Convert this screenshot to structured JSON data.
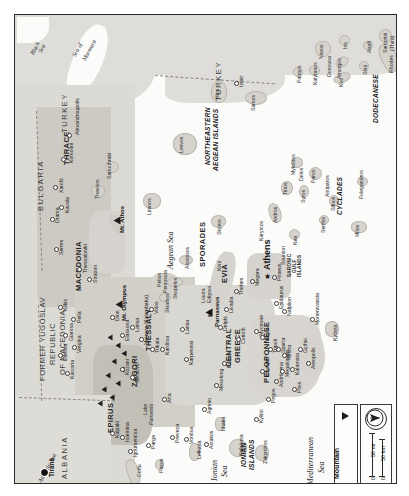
{
  "map": {
    "title": "Greece",
    "orientation": "rotated-90-ccw",
    "frame_border_color": "#2b2b2b",
    "sea_color": "#fbfbfa",
    "land_color": "#dedcd8",
    "highland_color": "#c3bfb8",
    "countries": [
      {
        "name": "TURKEY",
        "x": 46,
        "y": 118
      },
      {
        "name": "TURKEY",
        "x": 200,
        "y": 86
      },
      {
        "name": "BULGARIA",
        "x": 22,
        "y": 196
      },
      {
        "name": "FORMER YUGOSLAV",
        "x": 24,
        "y": 350
      },
      {
        "name": "REPUBLIC",
        "x": 34,
        "y": 345
      },
      {
        "name": "OF MACEDONIA",
        "x": 44,
        "y": 352
      },
      {
        "name": "ALBANIA",
        "x": 46,
        "y": 460
      }
    ],
    "regions": [
      {
        "name": "THRACE",
        "x": 48,
        "y": 139
      },
      {
        "name": "MACEDONIA",
        "x": 60,
        "y": 258
      },
      {
        "name": "NORTHEASTERN",
        "x": 194,
        "y": 119
      },
      {
        "name": "AEGEAN ISLANDS",
        "x": 202,
        "y": 122
      },
      {
        "name": "SPORADES",
        "x": 194,
        "y": 228
      },
      {
        "name": "THESSALY",
        "x": 129,
        "y": 312
      },
      {
        "name": "EVIA",
        "x": 213,
        "y": 252
      },
      {
        "name": "CYCLADES",
        "x": 330,
        "y": 178
      },
      {
        "name": "DODECANESE",
        "x": 368,
        "y": 78
      },
      {
        "name": "ZAGORI",
        "x": 117,
        "y": 354
      },
      {
        "name": "EPIRUS",
        "x": 96,
        "y": 403
      },
      {
        "name": "CENTRAL",
        "x": 216,
        "y": 339
      },
      {
        "name": "GREECE",
        "x": 224,
        "y": 343
      },
      {
        "name": "PELOPONNESE",
        "x": 253,
        "y": 337
      },
      {
        "name": "IONIAN",
        "x": 230,
        "y": 441
      },
      {
        "name": "ISLANDS",
        "x": 238,
        "y": 445
      },
      {
        "name": "SARONIC",
        "x": 277,
        "y": 248
      },
      {
        "name": "GULF",
        "x": 283,
        "y": 250
      },
      {
        "name": "ISLANDS",
        "x": 288,
        "y": 250
      }
    ],
    "waters": [
      {
        "name": "Black",
        "x": 20,
        "y": 30
      },
      {
        "name": "Sea",
        "x": 28,
        "y": 32
      },
      {
        "name": "Sea of",
        "x": 66,
        "y": 30
      },
      {
        "name": "Marmara",
        "x": 74,
        "y": 38
      },
      {
        "name": "Aegean Sea",
        "x": 158,
        "y": 230
      },
      {
        "name": "Ionian",
        "x": 200,
        "y": 455
      },
      {
        "name": "Sea",
        "x": 208,
        "y": 455
      },
      {
        "name": "Mediterranean",
        "x": 300,
        "y": 455
      },
      {
        "name": "Sea",
        "x": 310,
        "y": 462
      },
      {
        "name": "Adriatic Sea",
        "x": 30,
        "y": 480
      }
    ],
    "cities": [
      {
        "name": "Alexandroupolis",
        "x": 60,
        "y": 120
      },
      {
        "name": "Komotini",
        "x": 54,
        "y": 143
      },
      {
        "name": "Xanthi",
        "x": 44,
        "y": 168
      },
      {
        "name": "Kavala",
        "x": 50,
        "y": 190
      },
      {
        "name": "Drama",
        "x": 40,
        "y": 200
      },
      {
        "name": "Serres",
        "x": 44,
        "y": 230
      },
      {
        "name": "Thessaloniki",
        "x": 68,
        "y": 253
      },
      {
        "name": "Stratoni",
        "x": 78,
        "y": 262
      },
      {
        "name": "Kilkis",
        "x": 48,
        "y": 290
      },
      {
        "name": "Pella",
        "x": 62,
        "y": 301
      },
      {
        "name": "Giantsa",
        "x": 54,
        "y": 318
      },
      {
        "name": "Vergina",
        "x": 62,
        "y": 330
      },
      {
        "name": "Edessa",
        "x": 48,
        "y": 337
      },
      {
        "name": "Kastoria",
        "x": 55,
        "y": 355
      },
      {
        "name": "Kozani",
        "x": 110,
        "y": 351
      },
      {
        "name": "Dion",
        "x": 100,
        "y": 300
      },
      {
        "name": "Elassona",
        "x": 110,
        "y": 318
      },
      {
        "name": "Larisa",
        "x": 120,
        "y": 310
      },
      {
        "name": "Meteora (Kalambaka)",
        "x": 130,
        "y": 320
      },
      {
        "name": "Metsovo",
        "x": 120,
        "y": 360
      },
      {
        "name": "Trikala",
        "x": 140,
        "y": 330
      },
      {
        "name": "Karditsa",
        "x": 150,
        "y": 330
      },
      {
        "name": "Volos",
        "x": 139,
        "y": 292
      },
      {
        "name": "Kalpaki",
        "x": 100,
        "y": 415
      },
      {
        "name": "Ioannina",
        "x": 110,
        "y": 418
      },
      {
        "name": "Igoumenitsa",
        "x": 118,
        "y": 432
      },
      {
        "name": "Corfu",
        "x": 122,
        "y": 455
      },
      {
        "name": "Parga",
        "x": 136,
        "y": 425
      },
      {
        "name": "Preveza",
        "x": 160,
        "y": 418
      },
      {
        "name": "Arta",
        "x": 152,
        "y": 380
      },
      {
        "name": "Vonitsa",
        "x": 174,
        "y": 420
      },
      {
        "name": "Lefkada",
        "x": 182,
        "y": 436
      },
      {
        "name": "Astakos",
        "x": 194,
        "y": 425
      },
      {
        "name": "Agrinio",
        "x": 192,
        "y": 390
      },
      {
        "name": "Karpenissi",
        "x": 174,
        "y": 340
      },
      {
        "name": "Lamia",
        "x": 170,
        "y": 310
      },
      {
        "name": "Mesolong",
        "x": 204,
        "y": 366
      },
      {
        "name": "Patras",
        "x": 212,
        "y": 345
      },
      {
        "name": "Delphi",
        "x": 208,
        "y": 308
      },
      {
        "name": "Corinth",
        "x": 226,
        "y": 320
      },
      {
        "name": "Livadia",
        "x": 214,
        "y": 290
      },
      {
        "name": "Thebes",
        "x": 224,
        "y": 272
      },
      {
        "name": "Megara",
        "x": 240,
        "y": 262
      },
      {
        "name": "Athens",
        "x": 252,
        "y": 250
      },
      {
        "name": "Piraeus",
        "x": 262,
        "y": 258
      },
      {
        "name": "Mycenae",
        "x": 244,
        "y": 312
      },
      {
        "name": "Argos",
        "x": 250,
        "y": 318
      },
      {
        "name": "Tripoli",
        "x": 258,
        "y": 330
      },
      {
        "name": "Epidaurus",
        "x": 264,
        "y": 284
      },
      {
        "name": "Nafplion",
        "x": 272,
        "y": 292
      },
      {
        "name": "Olympia",
        "x": 250,
        "y": 352
      },
      {
        "name": "Andritsena",
        "x": 264,
        "y": 362
      },
      {
        "name": "Megalopolis",
        "x": 270,
        "y": 352
      },
      {
        "name": "Pirgos",
        "x": 256,
        "y": 380
      },
      {
        "name": "Kyllini",
        "x": 244,
        "y": 400
      },
      {
        "name": "Zakynthos",
        "x": 248,
        "y": 440
      },
      {
        "name": "Kefalonia",
        "x": 224,
        "y": 432
      },
      {
        "name": "Ithaka",
        "x": 206,
        "y": 410
      },
      {
        "name": "Mistra",
        "x": 272,
        "y": 336
      },
      {
        "name": "Sparta",
        "x": 266,
        "y": 330
      },
      {
        "name": "Kalamata",
        "x": 280,
        "y": 350
      },
      {
        "name": "Pilos",
        "x": 282,
        "y": 370
      },
      {
        "name": "Gythio",
        "x": 288,
        "y": 330
      },
      {
        "name": "Areopolis",
        "x": 296,
        "y": 344
      },
      {
        "name": "Monemvassia",
        "x": 300,
        "y": 300
      },
      {
        "name": "Kythira",
        "x": 318,
        "y": 316
      },
      {
        "name": "Izmir",
        "x": 224,
        "y": 66
      },
      {
        "name": "Tirana",
        "x": 32,
        "y": 455
      }
    ],
    "islands": [
      {
        "name": "Thassos",
        "x": 84,
        "y": 176
      },
      {
        "name": "Samothraki",
        "x": 96,
        "y": 150
      },
      {
        "name": "Limnos",
        "x": 136,
        "y": 190
      },
      {
        "name": "Lesvos",
        "x": 166,
        "y": 128
      },
      {
        "name": "Hios",
        "x": 202,
        "y": 76
      },
      {
        "name": "Samos",
        "x": 238,
        "y": 86
      },
      {
        "name": "Patmos",
        "x": 284,
        "y": 58
      },
      {
        "name": "Kalymnos",
        "x": 300,
        "y": 56
      },
      {
        "name": "Kos",
        "x": 326,
        "y": 64
      },
      {
        "name": "Simi",
        "x": 350,
        "y": 52
      },
      {
        "name": "Rhodes",
        "x": 378,
        "y": 46
      },
      {
        "name": "Karpathos",
        "x": 388,
        "y": 62
      },
      {
        "name": "Donousa",
        "x": 314,
        "y": 48
      },
      {
        "name": "Amorgos",
        "x": 326,
        "y": 48
      },
      {
        "name": "Naxos",
        "x": 308,
        "y": 32
      },
      {
        "name": "Ios",
        "x": 330,
        "y": 26
      },
      {
        "name": "Anafi",
        "x": 354,
        "y": 30
      },
      {
        "name": "Santorini",
        "x": 372,
        "y": 20
      },
      {
        "name": "(Thira)",
        "x": 380,
        "y": 20
      },
      {
        "name": "Paros",
        "x": 300,
        "y": 160
      },
      {
        "name": "Antiparos",
        "x": 316,
        "y": 168
      },
      {
        "name": "Sifnos",
        "x": 320,
        "y": 186
      },
      {
        "name": "Serifos",
        "x": 310,
        "y": 206
      },
      {
        "name": "Folegandros",
        "x": 348,
        "y": 168
      },
      {
        "name": "Milos",
        "x": 344,
        "y": 212
      },
      {
        "name": "Syros",
        "x": 290,
        "y": 178
      },
      {
        "name": "Mykonos",
        "x": 280,
        "y": 146
      },
      {
        "name": "Delos",
        "x": 286,
        "y": 156
      },
      {
        "name": "Tinos",
        "x": 272,
        "y": 170
      },
      {
        "name": "Andros",
        "x": 262,
        "y": 196
      },
      {
        "name": "Karystos",
        "x": 248,
        "y": 214
      },
      {
        "name": "Kea",
        "x": 280,
        "y": 222
      },
      {
        "name": "Sounion",
        "x": 268,
        "y": 238
      },
      {
        "name": "Skyros",
        "x": 204,
        "y": 208
      },
      {
        "name": "Kimi",
        "x": 206,
        "y": 248
      },
      {
        "name": "Alonissos",
        "x": 172,
        "y": 240
      },
      {
        "name": "Skopelos",
        "x": 160,
        "y": 272
      },
      {
        "name": "Skiathos",
        "x": 152,
        "y": 286
      },
      {
        "name": "Loutra",
        "x": 190,
        "y": 278
      },
      {
        "name": "Edipsoi",
        "x": 196,
        "y": 278
      },
      {
        "name": "Pelion",
        "x": 146,
        "y": 262
      },
      {
        "name": "Peninsula",
        "x": 152,
        "y": 264
      },
      {
        "name": "Lake",
        "x": 132,
        "y": 392
      },
      {
        "name": "Pamvotis",
        "x": 138,
        "y": 398
      },
      {
        "name": "Paxos",
        "x": 146,
        "y": 448
      }
    ],
    "peaks": [
      {
        "name": "Mt. Athos",
        "x": 104,
        "y": 204
      },
      {
        "name": "Mt. Olympus",
        "x": 106,
        "y": 288
      },
      {
        "name": "Mt.",
        "x": 194,
        "y": 294
      },
      {
        "name": "Parnassus",
        "x": 200,
        "y": 300
      }
    ],
    "legend": {
      "mountain_label": "Mountain",
      "mountain_symbol": "mountain-triangle-icon",
      "scale_mi_label": "50 mi",
      "scale_km_label": "50 km",
      "scale_zero_mi": "0",
      "scale_zero_km": "0",
      "compass": "north-arrow-icon"
    }
  }
}
